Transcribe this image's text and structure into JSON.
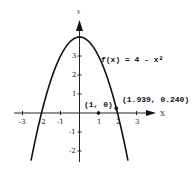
{
  "chart_data": {
    "type": "line",
    "title": "",
    "xlabel": "X",
    "ylabel": "Y",
    "xlim": [
      -3.5,
      3.5
    ],
    "ylim": [
      -2.5,
      4.5
    ],
    "grid": false,
    "x_ticks": [
      -3,
      -2,
      -1,
      1,
      2,
      3
    ],
    "y_ticks": [
      -2,
      -1,
      1,
      2,
      3
    ],
    "x_tick_labels": [
      "-3",
      "-2",
      "-1",
      "1",
      "2",
      "3"
    ],
    "y_tick_labels": [
      "-2",
      "-1",
      "1",
      "2",
      "3"
    ],
    "series": [
      {
        "name": "f(x) = 4 - x²",
        "function": "4 - x^2",
        "x_range": [
          -2.55,
          2.55
        ]
      }
    ],
    "points": [
      {
        "label": "(1, 0)",
        "x": 1,
        "y": 0
      },
      {
        "label": "(1.939, 0.240)",
        "x": 1.939,
        "y": 0.24
      }
    ],
    "annotations": [
      {
        "text": "f(x) = 4 - x²",
        "near": [
          1.5,
          3
        ]
      },
      {
        "text": "(1, 0)",
        "near": [
          1,
          0
        ]
      },
      {
        "text": "(1.939, 0.240)",
        "near": [
          1.939,
          0.24
        ]
      }
    ]
  },
  "labels": {
    "x_axis": "X",
    "y_axis": "Y",
    "func": "f(x) = 4 - x²",
    "pt1": "(1, 0)",
    "pt2": "(1.939, 0.240)",
    "xt": [
      "-3",
      "-2",
      "-1",
      "1",
      "2",
      "3"
    ],
    "yt": [
      "3",
      "2",
      "1",
      "-1",
      "-2"
    ]
  }
}
